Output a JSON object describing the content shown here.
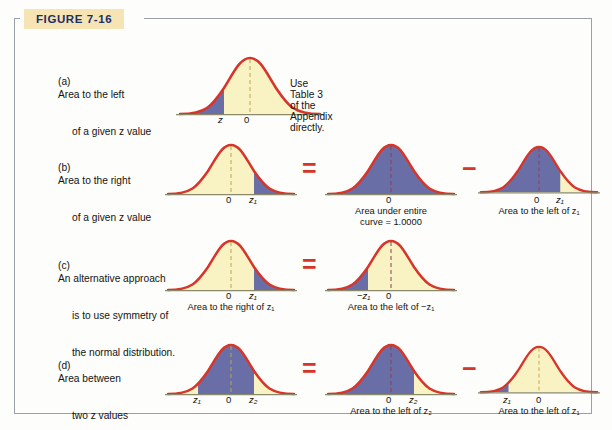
{
  "figure": {
    "tag": "FIGURE 7-16",
    "tag_bg": "#f6e4b4",
    "tag_color": "#1b2f6b"
  },
  "colors": {
    "curve_outline": "#d8352a",
    "fill_blue": "#6a6ea6",
    "fill_yellow": "#f9f3c4",
    "operator_red": "#d8352a",
    "axis": "#8a8a6a",
    "border": "#9aa0a6",
    "background": "#fdfdfb"
  },
  "note": "Use Table 3 of the Appendix directly.",
  "operators": {
    "equals": "=",
    "minus": "−"
  },
  "rows": [
    {
      "id": "a",
      "caption": "(a) Area to the left\n      of a given z value",
      "caption_prefix": "(a)",
      "caption_line1": "Area to the left",
      "caption_line2": "of a given z value",
      "panels": [
        {
          "name": "curve-a-1",
          "shaded": "left-tail",
          "ticks": [
            "z",
            "0"
          ],
          "sublabel": ""
        }
      ]
    },
    {
      "id": "b",
      "caption_prefix": "(b)",
      "caption_line1": "Area to the right",
      "caption_line2": "of a given z value",
      "panels": [
        {
          "name": "curve-b-1",
          "shaded": "right-tail",
          "ticks": [
            "0",
            "z₁"
          ],
          "sublabel": ""
        },
        {
          "name": "curve-b-2",
          "shaded": "entire",
          "ticks": [
            "0"
          ],
          "sublabel": "Area under entire\ncurve = 1.0000"
        },
        {
          "name": "curve-b-3",
          "shaded": "left-of-z1",
          "ticks": [
            "0",
            "z₁"
          ],
          "sublabel": "Area to the left of z₁"
        }
      ]
    },
    {
      "id": "c",
      "caption_prefix": "(c)",
      "caption_line1": "An alternative approach",
      "caption_line2": "is to use symmetry of",
      "caption_line3": "the normal distribution.",
      "panels": [
        {
          "name": "curve-c-1",
          "shaded": "right-tail",
          "ticks": [
            "0",
            "z₁"
          ],
          "sublabel": "Area to the right of z₁"
        },
        {
          "name": "curve-c-2",
          "shaded": "left-tail-negz1",
          "ticks": [
            "−z₁",
            "0"
          ],
          "sublabel": "Area to the left of −z₁"
        }
      ]
    },
    {
      "id": "d",
      "caption_prefix": "(d)",
      "caption_line1": "Area between",
      "caption_line2": "two z values",
      "panels": [
        {
          "name": "curve-d-1",
          "shaded": "between",
          "ticks": [
            "z₁",
            "0",
            "z₂"
          ],
          "sublabel": ""
        },
        {
          "name": "curve-d-2",
          "shaded": "left-of-z2",
          "ticks": [
            "0",
            "z₂"
          ],
          "sublabel": "Area to the left of z₂"
        },
        {
          "name": "curve-d-3",
          "shaded": "left-of-z1-small",
          "ticks": [
            "z₁",
            "0"
          ],
          "sublabel": "Area to the left of z₁"
        }
      ]
    }
  ],
  "tick_text": {
    "zero": "0",
    "z": "z",
    "z1": "z₁",
    "z2": "z₂",
    "negz1": "−z₁"
  }
}
